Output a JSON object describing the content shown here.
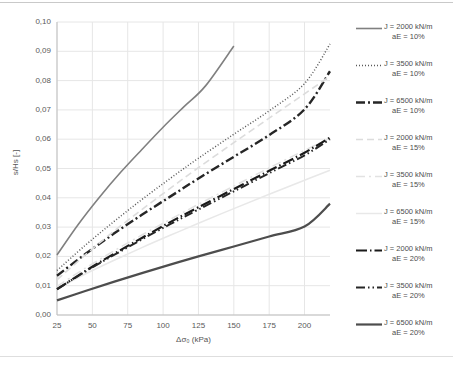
{
  "chart_data": {
    "type": "line",
    "title": "",
    "xlabel": "Δσ₀ (kPa)",
    "ylabel": "s/Hs [-]",
    "xlim": [
      25,
      218
    ],
    "ylim": [
      0.0,
      0.1
    ],
    "xticks": [
      "25",
      "50",
      "75",
      "100",
      "125",
      "150",
      "175",
      "200"
    ],
    "xtick_values": [
      25,
      50,
      75,
      100,
      125,
      150,
      175,
      200
    ],
    "yticks": [
      "0,00",
      "0,01",
      "0,02",
      "0,03",
      "0,04",
      "0,05",
      "0,06",
      "0,07",
      "0,08",
      "0,09",
      "0,10"
    ],
    "ytick_values": [
      0.0,
      0.01,
      0.02,
      0.03,
      0.04,
      0.05,
      0.06,
      0.07,
      0.08,
      0.09,
      0.1
    ],
    "grid": true,
    "legend_position": "right",
    "series": [
      {
        "name": "J = 2000 kN/m  aE = 10%",
        "label_line1": "J = 2000 kN/m",
        "label_line2": "aE = 10%",
        "style": "solid",
        "color": "#808080",
        "width": 1.6,
        "x": [
          25,
          40,
          55,
          70,
          85,
          100,
          115,
          130,
          150
        ],
        "y": [
          0.0205,
          0.0309,
          0.0402,
          0.0487,
          0.0565,
          0.0641,
          0.0712,
          0.0782,
          0.0918
        ]
      },
      {
        "name": "J = 3500 kN/m  aE = 10%",
        "label_line1": "J = 3500 kN/m",
        "label_line2": "aE = 10%",
        "style": "dotted",
        "color": "#595959",
        "width": 1.5,
        "x": [
          25,
          45,
          65,
          85,
          105,
          125,
          150,
          175,
          200,
          218
        ],
        "y": [
          0.0152,
          0.0238,
          0.0318,
          0.0394,
          0.0466,
          0.0535,
          0.0617,
          0.0697,
          0.079,
          0.0925
        ]
      },
      {
        "name": "J = 6500 kN/m  aE = 10%",
        "label_line1": "J = 6500 kN/m",
        "label_line2": "aE = 10%",
        "style": "dashdot",
        "color": "#262626",
        "width": 2.4,
        "x": [
          25,
          45,
          65,
          85,
          105,
          125,
          150,
          175,
          200,
          218
        ],
        "y": [
          0.0134,
          0.0208,
          0.0277,
          0.0342,
          0.0404,
          0.0466,
          0.054,
          0.0614,
          0.0702,
          0.0832
        ]
      },
      {
        "name": "J = 2000 kN/m  aE = 15%",
        "label_line1": "J = 2000 kN/m",
        "label_line2": "aE = 15%",
        "style": "dashed-light",
        "color": "#dcdcdc",
        "width": 1.6,
        "x": [
          25,
          45,
          65,
          85,
          105,
          125,
          150,
          175,
          200,
          218
        ],
        "y": [
          0.012,
          0.0205,
          0.0285,
          0.036,
          0.0432,
          0.0503,
          0.0588,
          0.0672,
          0.0755,
          0.0815
        ]
      },
      {
        "name": "J = 3500 kN/m  aE = 15%",
        "label_line1": "J = 3500 kN/m",
        "label_line2": "aE = 15%",
        "style": "dashdot-light",
        "color": "#e2e2e2",
        "width": 1.5,
        "x": [
          25,
          45,
          65,
          85,
          105,
          125,
          150,
          175,
          200,
          218
        ],
        "y": [
          0.0098,
          0.016,
          0.0218,
          0.0273,
          0.0326,
          0.0378,
          0.044,
          0.0502,
          0.0562,
          0.0604
        ]
      },
      {
        "name": "J = 6500 kN/m  aE = 15%",
        "label_line1": "J = 6500 kN/m",
        "label_line2": "aE = 15%",
        "style": "solid-light",
        "color": "#e8e8e8",
        "width": 1.5,
        "x": [
          25,
          45,
          65,
          85,
          105,
          125,
          150,
          175,
          200,
          218
        ],
        "y": [
          0.009,
          0.014,
          0.0186,
          0.023,
          0.0272,
          0.0313,
          0.0363,
          0.0412,
          0.046,
          0.0494
        ]
      },
      {
        "name": "J = 2000 kN/m  aE = 20%",
        "label_line1": "J = 2000 kN/m",
        "label_line2": "aE = 20%",
        "style": "longdash-dot",
        "color": "#1a1a1a",
        "width": 2.2,
        "x": [
          25,
          45,
          65,
          85,
          105,
          125,
          150,
          175,
          200,
          218
        ],
        "y": [
          0.0088,
          0.015,
          0.0208,
          0.0263,
          0.0317,
          0.0368,
          0.043,
          0.0492,
          0.0554,
          0.0606
        ]
      },
      {
        "name": "J = 3500 kN/m  aE = 20%",
        "label_line1": "J = 3500 kN/m",
        "label_line2": "aE = 20%",
        "style": "dashdotdot",
        "color": "#262626",
        "width": 2.0,
        "x": [
          25,
          45,
          65,
          85,
          105,
          125,
          150,
          175,
          200,
          218
        ],
        "y": [
          0.0088,
          0.0148,
          0.0204,
          0.0258,
          0.031,
          0.036,
          0.0422,
          0.0484,
          0.0545,
          0.06
        ]
      },
      {
        "name": "J = 6500 kN/m  aE = 20%",
        "label_line1": "J = 6500 kN/m",
        "label_line2": "aE = 20%",
        "style": "solid-dark",
        "color": "#4d4d4d",
        "width": 2.2,
        "x": [
          25,
          45,
          65,
          85,
          105,
          125,
          150,
          175,
          200,
          218
        ],
        "y": [
          0.005,
          0.0082,
          0.0113,
          0.0143,
          0.0172,
          0.02,
          0.0234,
          0.0268,
          0.0302,
          0.038
        ]
      }
    ]
  },
  "plot": {
    "left": 57,
    "right": 330,
    "top": 22,
    "bottom": 315
  },
  "colors": {
    "grid": "#e6e6e6",
    "axis": "#bfbfbf",
    "text": "#595959"
  }
}
